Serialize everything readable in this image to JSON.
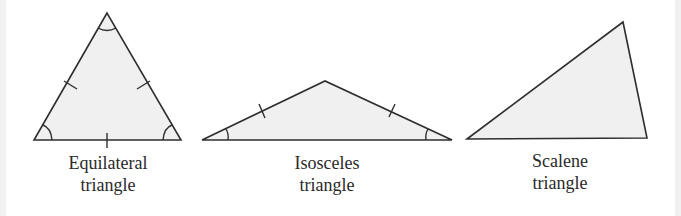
{
  "figure": {
    "colors": {
      "stroke": "#2e2e2e",
      "fill": "#f0f0f0",
      "edge_strip": "#f1f1f1"
    },
    "triangles": [
      {
        "id": "equilateral",
        "label_line1": "Equilateral",
        "label_line2": "triangle",
        "vertices": [
          [
            107,
            13
          ],
          [
            34,
            140
          ],
          [
            181,
            140
          ]
        ],
        "equal_side_ticks": 3,
        "angle_marks": 3
      },
      {
        "id": "isosceles",
        "label_line1": "Isosceles",
        "label_line2": "triangle",
        "vertices": [
          [
            202,
            140
          ],
          [
            325,
            81
          ],
          [
            452,
            140
          ]
        ],
        "equal_side_ticks": 2,
        "angle_marks": 2
      },
      {
        "id": "scalene",
        "label_line1": "Scalene",
        "label_line2": "triangle",
        "vertices": [
          [
            467,
            139
          ],
          [
            623,
            22
          ],
          [
            647,
            138
          ]
        ],
        "equal_side_ticks": 0,
        "angle_marks": 0
      }
    ]
  }
}
